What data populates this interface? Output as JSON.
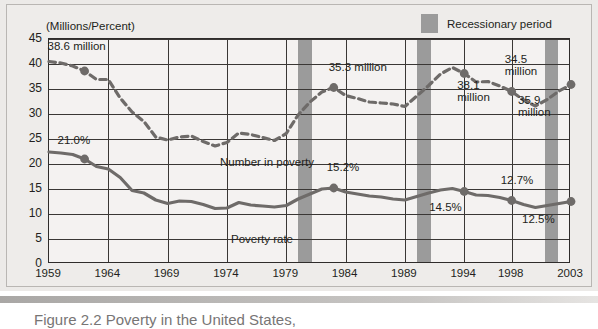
{
  "units_label": "(Millions/Percent)",
  "legend": {
    "swatch_name": "recession-swatch",
    "label": "Recessionary period"
  },
  "caption": {
    "figure_word": "Figure",
    "figure_number": "2.2",
    "text": "Figure  2.2  Poverty in the United States,"
  },
  "chart_data": {
    "type": "line",
    "xlabel": "",
    "ylabel": "(Millions/Percent)",
    "xlim": [
      1959,
      2003
    ],
    "ylim": [
      0,
      45
    ],
    "yticks": [
      0,
      5,
      10,
      15,
      20,
      25,
      30,
      35,
      40,
      45
    ],
    "xticks": [
      1959,
      1964,
      1969,
      1974,
      1979,
      1984,
      1989,
      1994,
      1998,
      2003
    ],
    "grid": true,
    "legend_position": "top-right",
    "series": [
      {
        "name": "Number in poverty",
        "units": "millions",
        "style": "dashed",
        "color": "#6e6b69",
        "label_x": 172,
        "label_y": 118,
        "x": [
          1959,
          1960,
          1961,
          1962,
          1963,
          1964,
          1965,
          1966,
          1967,
          1968,
          1969,
          1970,
          1971,
          1972,
          1973,
          1974,
          1975,
          1976,
          1977,
          1978,
          1979,
          1980,
          1981,
          1982,
          1983,
          1984,
          1985,
          1986,
          1987,
          1988,
          1989,
          1990,
          1991,
          1992,
          1993,
          1994,
          1995,
          1996,
          1997,
          1998,
          1999,
          2000,
          2001,
          2002,
          2003
        ],
        "values": [
          40.5,
          40.2,
          39.6,
          38.6,
          36.9,
          36.9,
          33.2,
          30.4,
          28.5,
          25.4,
          24.8,
          25.4,
          25.6,
          24.5,
          23.6,
          24.3,
          26.2,
          25.9,
          25.3,
          24.7,
          26.1,
          29.8,
          32.4,
          34.4,
          35.3,
          33.7,
          33.1,
          32.4,
          32.2,
          32.0,
          31.5,
          33.6,
          35.7,
          38.0,
          39.3,
          38.1,
          36.4,
          36.5,
          35.6,
          34.5,
          32.8,
          31.6,
          32.9,
          34.6,
          35.9
        ],
        "annotated_points": [
          {
            "year": 1962,
            "value": 38.6,
            "label": "38.6 million"
          },
          {
            "year": 1983,
            "value": 35.3,
            "label": "35.3 million"
          },
          {
            "year": 1994,
            "value": 38.1,
            "label": "38.1\nmillion"
          },
          {
            "year": 1998,
            "value": 34.5,
            "label": "34.5\nmillion"
          },
          {
            "year": 2003,
            "value": 35.9,
            "label": "35.9\nmillion"
          }
        ]
      },
      {
        "name": "Poverty rate",
        "units": "percent",
        "style": "solid",
        "color": "#6e6b69",
        "label_x": 183,
        "label_y": 195,
        "x": [
          1959,
          1960,
          1961,
          1962,
          1963,
          1964,
          1965,
          1966,
          1967,
          1968,
          1969,
          1970,
          1971,
          1972,
          1973,
          1974,
          1975,
          1976,
          1977,
          1978,
          1979,
          1980,
          1981,
          1982,
          1983,
          1984,
          1985,
          1986,
          1987,
          1988,
          1989,
          1990,
          1991,
          1992,
          1993,
          1994,
          1995,
          1996,
          1997,
          1998,
          1999,
          2000,
          2001,
          2002,
          2003
        ],
        "values": [
          22.4,
          22.2,
          21.9,
          21.0,
          19.5,
          19.0,
          17.3,
          14.7,
          14.2,
          12.8,
          12.1,
          12.6,
          12.5,
          11.9,
          11.1,
          11.2,
          12.3,
          11.8,
          11.6,
          11.4,
          11.7,
          13.0,
          14.0,
          15.0,
          15.2,
          14.4,
          14.0,
          13.6,
          13.4,
          13.0,
          12.8,
          13.5,
          14.2,
          14.8,
          15.1,
          14.5,
          13.8,
          13.7,
          13.3,
          12.7,
          11.9,
          11.3,
          11.7,
          12.1,
          12.5
        ],
        "annotated_points": [
          {
            "year": 1962,
            "value": 21.0,
            "label": "21.0%"
          },
          {
            "year": 1983,
            "value": 15.2,
            "label": "15.2%"
          },
          {
            "year": 1994,
            "value": 14.5,
            "label": "14.5%"
          },
          {
            "year": 1998,
            "value": 12.7,
            "label": "12.7%"
          },
          {
            "year": 2003,
            "value": 12.5,
            "label": "12.5%"
          }
        ]
      }
    ],
    "recession_bands": [
      {
        "start": 1980.0,
        "end": 1981.2
      },
      {
        "start": 1990.0,
        "end": 1991.2
      },
      {
        "start": 2000.8,
        "end": 2001.9
      }
    ]
  }
}
